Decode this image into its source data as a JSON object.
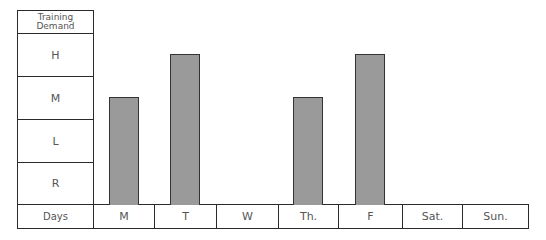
{
  "chart_data": {
    "type": "bar",
    "title": "",
    "xlabel": "Days",
    "ylabel": "Training Demand",
    "y_levels": [
      "R",
      "L",
      "M",
      "H"
    ],
    "categories": [
      "M",
      "T",
      "W",
      "Th.",
      "F",
      "Sat.",
      "Sun."
    ],
    "values": [
      "M",
      "H",
      null,
      "M",
      "H",
      null,
      null
    ],
    "values_numeric": [
      2.5,
      3.5,
      0,
      2.5,
      3.5,
      0,
      0
    ],
    "bar_color": "#9a9a9a",
    "grid": false,
    "legend": null
  },
  "yaxis": {
    "header": "Training Demand",
    "levels_top_to_bottom": [
      "H",
      "M",
      "L",
      "R"
    ]
  },
  "xaxis": {
    "label": "Days",
    "days": [
      "M",
      "T",
      "W",
      "Th.",
      "F",
      "Sat.",
      "Sun."
    ]
  }
}
